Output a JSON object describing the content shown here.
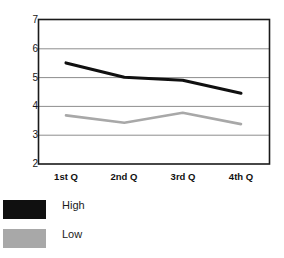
{
  "chart_data": {
    "type": "line",
    "title": "",
    "xlabel": "",
    "ylabel": "",
    "categories": [
      "1st Q",
      "2nd Q",
      "3rd Q",
      "4th Q"
    ],
    "ylim": [
      2,
      7
    ],
    "yticks": [
      2,
      3,
      4,
      5,
      6,
      7
    ],
    "ytick_labels": [
      "2",
      "3",
      "4",
      "5",
      "6",
      "7"
    ],
    "grid": true,
    "grid_axis": "y",
    "legend_position": "bottom-left",
    "series": [
      {
        "name": "High",
        "color": "#101010",
        "values": [
          5.5,
          5.0,
          4.9,
          4.45
        ]
      },
      {
        "name": "Low",
        "color": "#a8a8a8",
        "values": [
          3.68,
          3.43,
          3.77,
          3.38
        ]
      }
    ]
  },
  "axes": {
    "y_labels": [
      "7",
      "6",
      "5",
      "4",
      "3",
      "2"
    ],
    "x_labels": [
      "1st Q",
      "2nd Q",
      "3rd Q",
      "4th Q"
    ]
  },
  "legend": {
    "items": [
      {
        "label": "High",
        "color": "#101010"
      },
      {
        "label": "Low",
        "color": "#a8a8a8"
      }
    ]
  },
  "colors": {
    "axis": "#1a1a1a",
    "grid": "#8d8d8d",
    "high": "#101010",
    "low": "#a8a8a8",
    "background": "#ffffff"
  }
}
